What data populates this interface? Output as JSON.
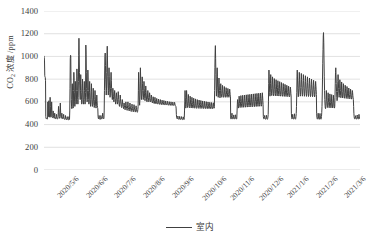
{
  "chart_data": {
    "type": "line",
    "title": "",
    "xlabel": "",
    "ylabel": "CO2 浓度 /ppm",
    "ylabel_prefix": "CO",
    "ylabel_sub": "2",
    "ylabel_suffix": " 浓度 /ppm",
    "ylim": [
      0,
      1400
    ],
    "ytick_step": 200,
    "yticks": [
      1400,
      1200,
      1000,
      800,
      600,
      400,
      200,
      0
    ],
    "ytick_labels": [
      "1400",
      "1200",
      "1000",
      "800",
      "600",
      "400",
      "200",
      "0"
    ],
    "grid": true,
    "grid_color": "#d9d9d9",
    "legend": {
      "position": "bottom-center",
      "entries": [
        {
          "name": "室内",
          "color": "#404040"
        }
      ]
    },
    "xtick_labels": [
      "2020/5/6",
      "2020/6/6",
      "2020/7/6",
      "2020/8/6",
      "2020/9/6",
      "2020/10/6",
      "2020/11/6",
      "2020/12/6",
      "2021/1/6",
      "2021/2/6",
      "2021/3/6"
    ],
    "x_start": "2020/5/6",
    "x_end": "2021/3/22",
    "series": [
      {
        "name": "室内",
        "color": "#404040",
        "line_width": 1,
        "values": [
          1005,
          990,
          960,
          830,
          820,
          815,
          790,
          470,
          455,
          450,
          452,
          455,
          450,
          448,
          455,
          600,
          520,
          480,
          470,
          610,
          545,
          470,
          465,
          520,
          640,
          560,
          475,
          465,
          470,
          520,
          600,
          530,
          470,
          462,
          460,
          470,
          520,
          480,
          465,
          458,
          455,
          470,
          500,
          470,
          458,
          452,
          450,
          455,
          470,
          490,
          465,
          455,
          450,
          448,
          452,
          470,
          505,
          560,
          520,
          470,
          462,
          455,
          470,
          540,
          590,
          520,
          470,
          460,
          455,
          462,
          500,
          470,
          458,
          452,
          450,
          455,
          470,
          490,
          460,
          452,
          448,
          445,
          450,
          460,
          480,
          455,
          448,
          445,
          442,
          448,
          455,
          470,
          450,
          445,
          442,
          440,
          445,
          455,
          470,
          450,
          445,
          520,
          720,
          980,
          1010,
          1005,
          760,
          620,
          560,
          540,
          620,
          760,
          700,
          600,
          545,
          560,
          700,
          860,
          790,
          680,
          600,
          560,
          640,
          780,
          700,
          620,
          580,
          600,
          700,
          890,
          820,
          700,
          620,
          580,
          640,
          780,
          1010,
          1160,
          1020,
          860,
          740,
          660,
          620,
          700,
          840,
          760,
          680,
          620,
          580,
          600,
          700,
          800,
          720,
          640,
          600,
          580,
          620,
          700,
          780,
          700,
          620,
          580,
          600,
          680,
          1100,
          1020,
          860,
          720,
          640,
          600,
          620,
          700,
          880,
          800,
          700,
          620,
          580,
          600,
          680,
          780,
          700,
          620,
          580,
          560,
          600,
          680,
          760,
          690,
          620,
          580,
          560,
          580,
          640,
          720,
          660,
          600,
          570,
          550,
          570,
          620,
          700,
          650,
          590,
          560,
          545,
          560,
          600,
          660,
          610,
          570,
          550,
          540,
          470,
          455,
          450,
          460,
          480,
          465,
          452,
          448,
          445,
          450,
          460,
          480,
          470,
          455,
          450,
          448,
          455,
          470,
          500,
          480,
          462,
          455,
          450,
          455,
          520,
          700,
          880,
          1000,
          1030,
          920,
          800,
          720,
          660,
          700,
          860,
          1010,
          1090,
          960,
          820,
          720,
          660,
          700,
          820,
          900,
          820,
          740,
          680,
          640,
          660,
          720,
          800,
          860,
          790,
          720,
          670,
          640,
          620,
          660,
          720,
          690,
          650,
          620,
          600,
          620,
          660,
          700,
          670,
          630,
          600,
          580,
          600,
          640,
          680,
          650,
          620,
          600,
          580,
          600,
          640,
          690,
          660,
          620,
          590,
          570,
          560,
          580,
          620,
          660,
          630,
          600,
          580,
          560,
          550,
          560,
          590,
          620,
          600,
          575,
          560,
          545,
          540,
          560,
          590,
          570,
          550,
          540,
          530,
          545,
          570,
          600,
          580,
          555,
          540,
          530,
          525,
          540,
          570,
          600,
          575,
          550,
          535,
          525,
          520,
          530,
          560,
          590,
          565,
          545,
          530,
          520,
          515,
          525,
          550,
          580,
          560,
          540,
          525,
          518,
          512,
          520,
          545,
          575,
          555,
          535,
          522,
          515,
          510,
          518,
          540,
          565,
          548,
          530,
          518,
          510,
          508,
          515,
          535,
          560,
          700,
          860,
          760,
          660,
          600,
          570,
          620,
          780,
          900,
          810,
          720,
          660,
          620,
          660,
          740,
          820,
          760,
          700,
          650,
          620,
          640,
          700,
          780,
          720,
          670,
          630,
          610,
          630,
          680,
          740,
          700,
          660,
          625,
          605,
          600,
          620,
          660,
          700,
          670,
          640,
          615,
          600,
          610,
          640,
          680,
          660,
          630,
          610,
          600,
          605,
          630,
          660,
          640,
          615,
          600,
          590,
          595,
          615,
          645,
          625,
          605,
          590,
          585,
          590,
          610,
          640,
          620,
          600,
          588,
          582,
          588,
          605,
          630,
          612,
          595,
          585,
          580,
          585,
          600,
          625,
          608,
          592,
          582,
          578,
          582,
          598,
          620,
          605,
          590,
          580,
          575,
          580,
          596,
          615,
          600,
          586,
          578,
          574,
          578,
          592,
          612,
          598,
          585,
          576,
          572,
          576,
          590,
          608,
          596,
          583,
          575,
          572,
          575,
          588,
          605,
          593,
          581,
          574,
          570,
          574,
          586,
          602,
          590,
          579,
          572,
          569,
          572,
          584,
          600,
          589,
          578,
          571,
          568,
          571,
          583,
          598,
          588,
          577,
          570,
          567,
          570,
          582,
          596,
          586,
          576,
          569,
          566,
          560,
          545,
          490,
          465,
          455,
          450,
          452,
          460,
          475,
          462,
          452,
          448,
          445,
          448,
          458,
          472,
          460,
          450,
          446,
          444,
          447,
          456,
          470,
          458,
          449,
          445,
          443,
          446,
          455,
          468,
          457,
          448,
          444,
          460,
          520,
          600,
          700,
          640,
          580,
          545,
          560,
          620,
          700,
          660,
          600,
          565,
          550,
          565,
          610,
          665,
          630,
          585,
          560,
          548,
          560,
          600,
          650,
          620,
          580,
          556,
          546,
          556,
          592,
          640,
          612,
          575,
          554,
          545,
          554,
          588,
          632,
          606,
          572,
          552,
          544,
          552,
          584,
          626,
          602,
          570,
          551,
          543,
          551,
          580,
          620,
          598,
          568,
          550,
          543,
          550,
          578,
          616,
          596,
          566,
          549,
          542,
          549,
          576,
          612,
          594,
          565,
          548,
          542,
          548,
          574,
          608,
          592,
          564,
          547,
          541,
          547,
          572,
          605,
          590,
          563,
          546,
          541,
          546,
          570,
          602,
          588,
          562,
          546,
          540,
          546,
          568,
          599,
          586,
          561,
          545,
          540,
          545,
          566,
          596,
          585,
          560,
          545,
          539,
          545,
          565,
          594,
          583,
          559,
          544,
          539,
          544,
          564,
          592,
          582,
          559,
          544,
          560,
          700,
          900,
          1030,
          1095,
          980,
          840,
          720,
          650,
          700,
          820,
          900,
          820,
          730,
          670,
          640,
          670,
          740,
          810,
          760,
          700,
          660,
          635,
          650,
          700,
          760,
          720,
          675,
          648,
          640,
          655,
          700,
          745,
          710,
          670,
          646,
          640,
          652,
          690,
          735,
          705,
          668,
          646,
          640,
          650,
          685,
          725,
          700,
          666,
          645,
          640,
          648,
          680,
          718,
          696,
          664,
          645,
          640,
          646,
          676,
          712,
          692,
          662,
          644,
          455,
          448,
          450,
          460,
          480,
          500,
          470,
          455,
          450,
          448,
          452,
          465,
          485,
          470,
          456,
          450,
          448,
          452,
          466,
          486,
          472,
          457,
          450,
          448,
          455,
          520,
          580,
          620,
          600,
          565,
          545,
          555,
          600,
          650,
          625,
          585,
          560,
          550,
          562,
          605,
          655,
          628,
          588,
          562,
          551,
          563,
          608,
          658,
          630,
          590,
          564,
          552,
          564,
          610,
          660,
          632,
          592,
          565,
          553,
          565,
          612,
          662,
          634,
          594,
          566,
          554,
          566,
          614,
          664,
          636,
          596,
          568,
          555,
          568,
          616,
          666,
          638,
          598,
          569,
          556,
          569,
          618,
          668,
          640,
          600,
          570,
          557,
          570,
          620,
          670,
          642,
          602,
          572,
          558,
          572,
          622,
          672,
          644,
          604,
          573,
          559,
          573,
          624,
          674,
          646,
          606,
          574,
          560,
          574,
          626,
          676,
          648,
          608,
          576,
          561,
          576,
          628,
          678,
          650,
          610,
          577,
          562,
          577,
          630,
          680,
          652,
          612,
          578,
          470,
          455,
          450,
          452,
          462,
          480,
          465,
          452,
          448,
          446,
          450,
          462,
          482,
          466,
          453,
          448,
          446,
          452,
          466,
          488,
          600,
          760,
          880,
          820,
          740,
          680,
          650,
          680,
          760,
          840,
          790,
          720,
          675,
          655,
          680,
          750,
          820,
          775,
          715,
          672,
          654,
          676,
          740,
          805,
          765,
          710,
          670,
          653,
          672,
          732,
          795,
          758,
          706,
          668,
          652,
          670,
          726,
          786,
          752,
          702,
          666,
          651,
          668,
          720,
          778,
          746,
          698,
          664,
          650,
          666,
          714,
          770,
          740,
          694,
          662,
          649,
          664,
          708,
          762,
          734,
          690,
          660,
          648,
          662,
          702,
          754,
          728,
          686,
          658,
          647,
          660,
          696,
          746,
          722,
          682,
          656,
          646,
          658,
          690,
          738,
          716,
          678,
          654,
          645,
          656,
          684,
          730,
          710,
          674,
          652,
          500,
          460,
          450,
          452,
          465,
          490,
          470,
          455,
          449,
          447,
          452,
          468,
          495,
          473,
          456,
          450,
          447,
          453,
          470,
          498,
          560,
          680,
          820,
          880,
          810,
          730,
          670,
          645,
          660,
          720,
          790,
          860,
          800,
          730,
          680,
          650,
          665,
          725,
          795,
          850,
          795,
          728,
          678,
          650,
          664,
          720,
          786,
          840,
          788,
          725,
          676,
          649,
          662,
          715,
          778,
          830,
          780,
          722,
          674,
          648,
          660,
          710,
          770,
          820,
          772,
          718,
          672,
          647,
          658,
          705,
          762,
          810,
          765,
          715,
          670,
          646,
          656,
          700,
          754,
          800,
          758,
          712,
          668,
          645,
          654,
          695,
          746,
          790,
          752,
          709,
          666,
          644,
          652,
          690,
          738,
          780,
          745,
          706,
          664,
          500,
          462,
          450,
          448,
          452,
          470,
          500,
          475,
          456,
          449,
          446,
          450,
          466,
          498,
          478,
          458,
          450,
          447,
          452,
          470,
          505,
          560,
          660,
          800,
          940,
          1060,
          1180,
          1210,
          1120,
          960,
          820,
          700,
          620,
          570,
          545,
          540,
          560,
          620,
          700,
          660,
          605,
          570,
          550,
          560,
          610,
          680,
          640,
          595,
          566,
          548,
          558,
          605,
          670,
          634,
          592,
          564,
          547,
          556,
          600,
          664,
          630,
          590,
          563,
          546,
          554,
          596,
          658,
          626,
          588,
          562,
          545,
          560,
          640,
          760,
          860,
          900,
          840,
          760,
          690,
          640,
          610,
          625,
          690,
          780,
          840,
          790,
          720,
          670,
          640,
          655,
          715,
          795,
          760,
          700,
          658,
          636,
          650,
          705,
          775,
          740,
          690,
          652,
          634,
          646,
          695,
          760,
          728,
          682,
          648,
          632,
          642,
          686,
          746,
          718,
          676,
          645,
          630,
          640,
          678,
          735,
          710,
          670,
          642,
          628,
          638,
          670,
          722,
          700,
          664,
          640,
          626,
          636,
          664,
          712,
          692,
          660,
          638,
          624,
          634,
          658,
          700,
          682,
          654,
          635,
          620,
          560,
          500,
          470,
          455,
          450,
          452,
          460,
          478,
          466,
          454,
          449,
          447,
          451,
          464,
          484,
          470,
          456,
          450,
          448,
          453,
          468,
          490,
          474,
          458,
          451,
          448
        ]
      }
    ]
  }
}
